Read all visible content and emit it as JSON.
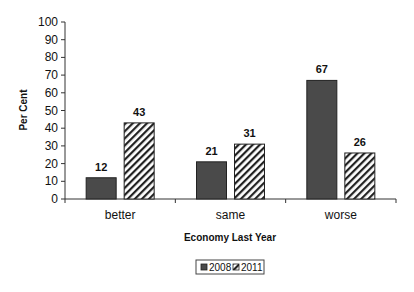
{
  "chart_data": {
    "type": "bar",
    "title": "",
    "xlabel": "Economy Last Year",
    "ylabel": "Per Cent",
    "ylim": [
      0,
      100
    ],
    "yticks": [
      0,
      10,
      20,
      30,
      40,
      50,
      60,
      70,
      80,
      90,
      100
    ],
    "categories": [
      "better",
      "same",
      "worse"
    ],
    "series": [
      {
        "name": "2008",
        "values": [
          12,
          21,
          67
        ],
        "fill": "solid",
        "color": "#4a4a4a"
      },
      {
        "name": "2011",
        "values": [
          43,
          31,
          26
        ],
        "fill": "diagonal-hatch",
        "color": "#ffffff"
      }
    ],
    "grid": false,
    "legend_position": "bottom",
    "data_labels": true
  }
}
